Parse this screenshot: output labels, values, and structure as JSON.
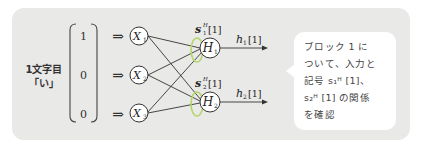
{
  "left_label": {
    "line1": "1文字目",
    "line2": "「い」"
  },
  "input_vector": {
    "values": [
      "1",
      "0",
      "0"
    ]
  },
  "input_arrow_symbol": "⇒",
  "input_nodes": [
    {
      "label": "X",
      "sub": "1"
    },
    {
      "label": "X",
      "sub": "2"
    },
    {
      "label": "X",
      "sub": "3"
    }
  ],
  "hidden_nodes": [
    {
      "label": "H",
      "sub": "1",
      "state_label": "s",
      "state_sup": "H",
      "state_sub": "1",
      "state_index": "[1]",
      "output_label": "h",
      "output_sub": "1",
      "output_index": "[1]"
    },
    {
      "label": "H",
      "sub": "2",
      "state_label": "s",
      "state_sup": "H",
      "state_sub": "2",
      "state_index": "[1]",
      "output_label": "h",
      "output_sub": "2",
      "output_index": "[1]"
    }
  ],
  "callout": {
    "lines": [
      "ブロック 1 に",
      "ついて、入力と",
      "記号 s₁ᴴ [1]、",
      "s₂ᴴ [1] の関係",
      "を確認"
    ]
  },
  "colors": {
    "panel_bg": "#e9e9e8",
    "loop_highlight": "#b5d46a",
    "line": "#333333",
    "callout_bg": "#ffffff"
  }
}
